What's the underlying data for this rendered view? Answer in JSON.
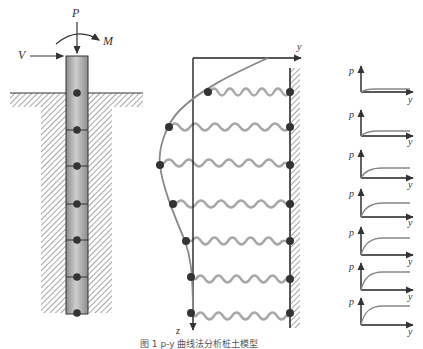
{
  "figure": {
    "caption": "图 1 p-y 曲线法分析桩土模型",
    "colors": {
      "line": "#222222",
      "spring": "#a8a8a8",
      "curve": "#888888",
      "node": "#333333",
      "pile_fill": "#b8b8b8"
    }
  },
  "pile_panel": {
    "load_labels": {
      "axial": "P",
      "moment": "M",
      "lateral": "V"
    },
    "node_count": 7
  },
  "spring_panel": {
    "axis_labels": {
      "horizontal": "y",
      "vertical": "z"
    },
    "spring_count": 7
  },
  "py_curves": {
    "p_label": "p",
    "y_label": "y",
    "count": 7
  }
}
